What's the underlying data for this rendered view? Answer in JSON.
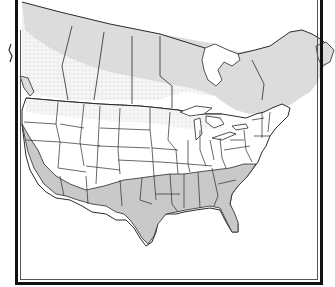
{
  "map": {
    "title": "",
    "description": "Outline map of Canada and the contiguous United States showing three shaded zones",
    "colors": {
      "background": "#ffffff",
      "northern_zone": "#dcdcdc",
      "dotted_zone_base": "#f4f4f4",
      "dotted_zone_dots": "#c8c8c8",
      "southern_zone": "#c9c9c9",
      "borders": "#2a2a2a",
      "frame_outer": "#111111",
      "frame_inner": "#555555"
    },
    "regions": [
      {
        "id": "northern-zone",
        "label": "Northern Canada band (light gray)",
        "fill": "light-gray"
      },
      {
        "id": "middle-zone",
        "label": "Southern Canada / northern US band (dotted)",
        "fill": "dotted"
      },
      {
        "id": "southern-zone",
        "label": "Southern US: California, Arizona, New Mexico, Texas, Gulf states, Southeast (gray)",
        "fill": "gray"
      }
    ],
    "left_edge_mark": "illegible vertical label"
  }
}
